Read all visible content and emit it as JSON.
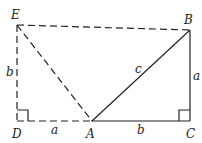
{
  "diagram": {
    "points": {
      "E": {
        "label": "E",
        "x": 17,
        "y": 25
      },
      "B": {
        "label": "B",
        "x": 190,
        "y": 30
      },
      "D": {
        "label": "D",
        "x": 17,
        "y": 121
      },
      "A": {
        "label": "A",
        "x": 92,
        "y": 121
      },
      "C": {
        "label": "C",
        "x": 190,
        "y": 121
      }
    },
    "segments": [
      {
        "from": "A",
        "to": "B",
        "style": "solid",
        "label": "c"
      },
      {
        "from": "B",
        "to": "C",
        "style": "solid",
        "label": "a"
      },
      {
        "from": "A",
        "to": "C",
        "style": "solid",
        "label": "b"
      },
      {
        "from": "E",
        "to": "B",
        "style": "dashed",
        "label": ""
      },
      {
        "from": "E",
        "to": "A",
        "style": "dashed",
        "label": ""
      },
      {
        "from": "E",
        "to": "D",
        "style": "dashed",
        "label": "b"
      },
      {
        "from": "D",
        "to": "A",
        "style": "dashed",
        "label": "a"
      }
    ],
    "right_angles": [
      "D",
      "C"
    ],
    "labels": {
      "E": "E",
      "B": "B",
      "D": "D",
      "A": "A",
      "C": "C",
      "side_AB": "c",
      "side_BC": "a",
      "side_AC": "b",
      "side_ED": "b",
      "side_DA": "a"
    }
  }
}
